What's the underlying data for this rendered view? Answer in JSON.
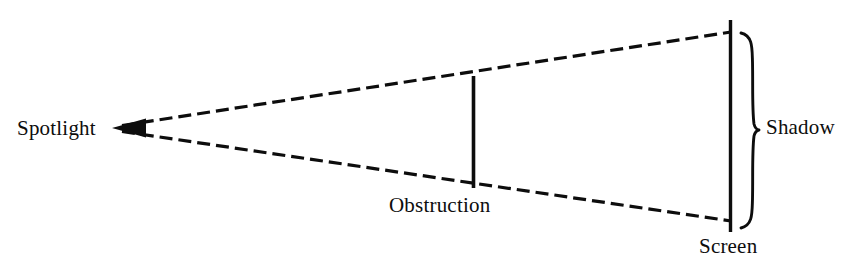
{
  "figure": {
    "title": "",
    "type": "optics-shadow-diagram",
    "background_color": "#ffffff",
    "stroke_color": "#0d0d0d",
    "labels": {
      "spotlight": "Spotlight",
      "obstruction": "Obstruction",
      "shadow": "Shadow",
      "screen": "Screen"
    },
    "elements": {
      "light_source": {
        "name": "Spotlight",
        "apex_x": 113,
        "apex_y": 128,
        "arrowhead": "left-pointing-solid-triangle"
      },
      "upper_ray": {
        "style": "dashed",
        "from_x": 118,
        "from_y": 126,
        "to_x": 730,
        "to_y": 32
      },
      "lower_ray": {
        "style": "dashed",
        "from_x": 118,
        "from_y": 131,
        "to_x": 730,
        "to_y": 221
      },
      "obstruction_bar": {
        "style": "solid-vertical",
        "x": 473,
        "top_y": 76,
        "bottom_y": 188
      },
      "screen_line": {
        "style": "solid-vertical",
        "x": 730,
        "top_y": 20,
        "bottom_y": 232
      },
      "shadow_brace": {
        "style": "curly-brace-right",
        "x": 742,
        "top_y": 33,
        "bottom_y": 228,
        "tip_y": 130
      }
    }
  }
}
